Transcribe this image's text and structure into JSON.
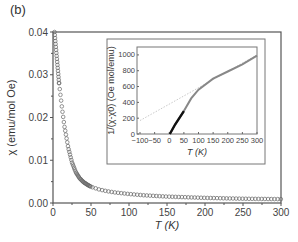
{
  "panel_label": "(b)",
  "chart_data": [
    {
      "type": "scatter",
      "title": "",
      "xlabel": "T (K)",
      "ylabel": "χ (emu/mol Oe)",
      "xlim": [
        0,
        300
      ],
      "ylim": [
        0.0,
        0.04
      ],
      "xticks": [
        "0",
        "50",
        "100",
        "150",
        "200",
        "250",
        "300"
      ],
      "yticks": [
        "0.00",
        "0.01",
        "0.02",
        "0.03",
        "0.04"
      ],
      "grid": false,
      "marker": "open-circle",
      "series": [
        {
          "name": "χ(T)",
          "x": [
            2,
            4,
            6,
            8,
            10,
            12,
            15,
            18,
            20,
            25,
            30,
            35,
            40,
            45,
            50,
            60,
            70,
            80,
            100,
            120,
            150,
            200,
            250,
            300
          ],
          "y": [
            0.04,
            0.036,
            0.032,
            0.028,
            0.025,
            0.022,
            0.018,
            0.015,
            0.013,
            0.0095,
            0.0072,
            0.0058,
            0.0049,
            0.0043,
            0.0038,
            0.0032,
            0.0028,
            0.0025,
            0.0021,
            0.0018,
            0.0015,
            0.0012,
            0.001,
            0.0009
          ]
        }
      ]
    },
    {
      "type": "line",
      "title": "inset",
      "xlabel": "T (K)",
      "ylabel": "1/(χ-χ0) (Oe mol/emu)",
      "xlim": [
        -100,
        300
      ],
      "ylim": [
        0,
        1100
      ],
      "xticks": [
        "-100",
        "-50",
        "0",
        "50",
        "100",
        "150",
        "200",
        "250",
        "300"
      ],
      "yticks": [
        "0",
        "200",
        "400",
        "600",
        "800",
        "1000"
      ],
      "series": [
        {
          "name": "data",
          "x": [
            2,
            20,
            50,
            75,
            100,
            150,
            200,
            250,
            300
          ],
          "y": [
            0,
            120,
            290,
            450,
            560,
            700,
            790,
            880,
            990
          ]
        },
        {
          "name": "Curie-Weiss fit (dotted)",
          "x": [
            -100,
            300
          ],
          "y": [
            170,
            1000
          ]
        }
      ]
    }
  ]
}
